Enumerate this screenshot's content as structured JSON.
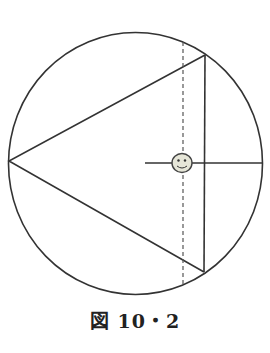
{
  "figure": {
    "caption": "図 10・2",
    "stroke_color": "#333333",
    "smiley_fill": "#e6e6d8"
  }
}
